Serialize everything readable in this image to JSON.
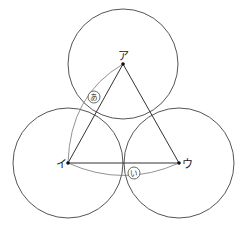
{
  "diagram": {
    "points": {
      "a": {
        "label": "ア",
        "x": 123,
        "y": 64
      },
      "i": {
        "label": "イ",
        "x": 68,
        "y": 163
      },
      "u": {
        "label": "ウ",
        "x": 179,
        "y": 163
      }
    },
    "circle_radius": 55,
    "arc_labels": {
      "ア_イ": "あ",
      "イ_ウ": "い"
    },
    "colors": {
      "line": "#555555",
      "triangle": "#333333",
      "background": "#ffffff"
    }
  }
}
